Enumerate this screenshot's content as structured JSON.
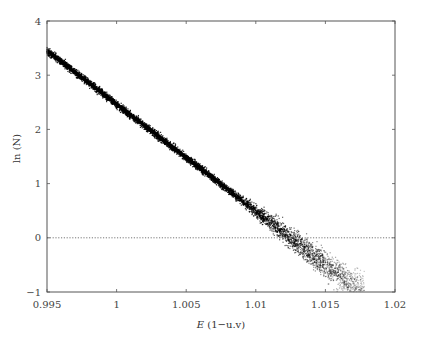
{
  "chart_data": {
    "type": "scatter",
    "title": "",
    "xlabel": "E (1−u.v)",
    "xlabel_italic": "E",
    "xlabel_rest": " (1−u.v)",
    "ylabel": "ln (N)",
    "xlim": [
      0.995,
      1.02
    ],
    "ylim": [
      -1,
      4
    ],
    "x_ticks": [
      0.995,
      1,
      1.005,
      1.01,
      1.015,
      1.02
    ],
    "x_tick_labels": [
      "0.995",
      "1",
      "1.005",
      "1.01",
      "1.015",
      "1.02"
    ],
    "y_ticks": [
      -1,
      0,
      1,
      2,
      3,
      4
    ],
    "y_tick_labels": [
      "−1",
      "0",
      "1",
      "2",
      "3",
      "4"
    ],
    "grid": false,
    "legend": null,
    "reference_line": {
      "y": 0,
      "style": "dotted"
    },
    "series": [
      {
        "name": "ln(N) vs E",
        "description": "Dense scatter forming a straight decreasing band; tight at low E, increasingly dispersed below ln(N)≈0.5",
        "x": [
          0.995,
          0.9975,
          1.0,
          1.0025,
          1.005,
          1.0075,
          1.01,
          1.0115,
          1.0125,
          1.0135,
          1.015,
          1.016,
          1.0175
        ],
        "y": [
          3.45,
          2.96,
          2.46,
          1.97,
          1.48,
          0.99,
          0.49,
          0.2,
          0.0,
          -0.2,
          -0.49,
          -0.69,
          -0.98
        ],
        "color": "#000000"
      }
    ]
  }
}
